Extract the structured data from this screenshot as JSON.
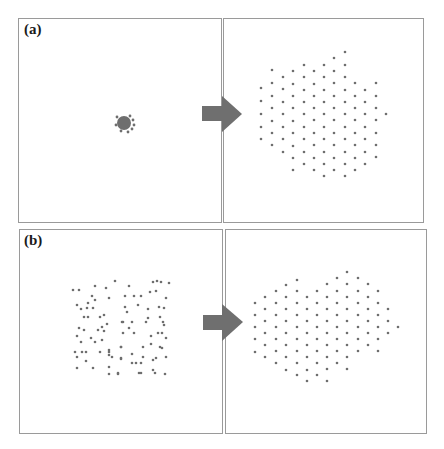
{
  "figure": {
    "panels": [
      {
        "id": "a-initial",
        "row_label": "(a)",
        "x": 18,
        "y": 18,
        "w": 204,
        "h": 205
      },
      {
        "id": "a-final",
        "row_label": "",
        "x": 223,
        "y": 18,
        "w": 201,
        "h": 205
      },
      {
        "id": "b-initial",
        "row_label": "(b)",
        "x": 19,
        "y": 229,
        "w": 204,
        "h": 205
      },
      {
        "id": "b-final",
        "row_label": "",
        "x": 225,
        "y": 229,
        "w": 202,
        "h": 205
      }
    ],
    "row_labels": {
      "a": "(a)",
      "b": "(b)"
    },
    "colors": {
      "dot": "#6e6e6e",
      "arrow": "#6f6f6f",
      "border": "#9a9a9a"
    },
    "arrows": [
      {
        "row": "a",
        "shaft": [
          202,
          106,
          222,
          121
        ],
        "head": [
          [
            222,
            96
          ],
          [
            242,
            114
          ],
          [
            222,
            132
          ]
        ]
      },
      {
        "row": "b",
        "shaft": [
          203,
          315,
          222,
          330
        ],
        "head": [
          [
            222,
            304
          ],
          [
            243,
            322
          ],
          [
            222,
            341
          ]
        ]
      }
    ],
    "a_initial_cluster": {
      "cx": 124,
      "cy": 123,
      "r": 7,
      "stray": [
        [
          117,
          117
        ],
        [
          130,
          116
        ],
        [
          133,
          120
        ],
        [
          132,
          129
        ],
        [
          121,
          131
        ],
        [
          128,
          132
        ],
        [
          116,
          125
        ],
        [
          134,
          125
        ]
      ]
    },
    "a_final_lattice": [
      [
        261,
        [
          88,
          101,
          114,
          127,
          139
        ]
      ],
      [
        272,
        [
          70,
          83,
          96,
          108,
          121,
          133,
          145
        ]
      ],
      [
        283,
        [
          77,
          89,
          102,
          114,
          127,
          139,
          152
        ]
      ],
      [
        293,
        [
          71,
          84,
          96,
          108,
          121,
          133,
          146,
          158,
          170
        ]
      ],
      [
        304,
        [
          65,
          77,
          90,
          102,
          114,
          127,
          139,
          152,
          164
        ]
      ],
      [
        314,
        [
          71,
          84,
          96,
          108,
          120,
          133,
          145,
          158,
          170
        ]
      ],
      [
        324,
        [
          65,
          77,
          90,
          102,
          114,
          127,
          139,
          152,
          164,
          176
        ]
      ],
      [
        334,
        [
          58,
          71,
          83,
          96,
          108,
          120,
          133,
          145,
          158,
          170
        ]
      ],
      [
        345,
        [
          52,
          65,
          77,
          90,
          102,
          114,
          127,
          139,
          152,
          164,
          176
        ]
      ],
      [
        355,
        [
          83,
          96,
          108,
          120,
          133,
          145,
          158,
          170
        ]
      ],
      [
        365,
        [
          90,
          102,
          114,
          127,
          139,
          152,
          164
        ]
      ],
      [
        376,
        [
          83,
          96,
          108,
          120,
          133,
          145,
          157
        ]
      ],
      [
        386,
        [
          114
        ]
      ]
    ],
    "b_initial_scatter": [
      [
        73,
        290
      ],
      [
        79,
        290
      ],
      [
        95,
        286
      ],
      [
        106,
        288
      ],
      [
        92,
        296
      ],
      [
        95,
        300
      ],
      [
        109,
        298
      ],
      [
        77,
        305
      ],
      [
        88,
        303
      ],
      [
        81,
        309
      ],
      [
        87,
        308
      ],
      [
        93,
        308
      ],
      [
        84,
        317
      ],
      [
        88,
        317
      ],
      [
        100,
        317
      ],
      [
        104,
        315
      ],
      [
        107,
        324
      ],
      [
        102,
        327
      ],
      [
        79,
        328
      ],
      [
        84,
        330
      ],
      [
        98,
        330
      ],
      [
        104,
        331
      ],
      [
        77,
        336
      ],
      [
        91,
        338
      ],
      [
        81,
        342
      ],
      [
        95,
        342
      ],
      [
        102,
        340
      ],
      [
        75,
        352
      ],
      [
        82,
        352
      ],
      [
        86,
        352
      ],
      [
        100,
        352
      ],
      [
        77,
        357
      ],
      [
        109,
        355
      ],
      [
        86,
        361
      ],
      [
        77,
        368
      ],
      [
        93,
        368
      ],
      [
        109,
        367
      ],
      [
        109,
        374
      ],
      [
        118,
        374
      ],
      [
        121,
        347
      ],
      [
        122,
        322
      ],
      [
        121,
        358
      ],
      [
        115,
        281
      ],
      [
        129,
        286
      ],
      [
        153,
        282
      ],
      [
        157,
        281
      ],
      [
        161,
        282
      ],
      [
        169,
        283
      ],
      [
        125,
        296
      ],
      [
        134,
        296
      ],
      [
        141,
        296
      ],
      [
        150,
        292
      ],
      [
        156,
        291
      ],
      [
        166,
        298
      ],
      [
        125,
        307
      ],
      [
        127,
        312
      ],
      [
        138,
        305
      ],
      [
        148,
        309
      ],
      [
        159,
        307
      ],
      [
        164,
        308
      ],
      [
        123,
        322
      ],
      [
        132,
        322
      ],
      [
        146,
        322
      ],
      [
        148,
        318
      ],
      [
        160,
        317
      ],
      [
        163,
        322
      ],
      [
        164,
        325
      ],
      [
        129,
        328
      ],
      [
        134,
        333
      ],
      [
        123,
        333
      ],
      [
        151,
        336
      ],
      [
        158,
        333
      ],
      [
        162,
        333
      ],
      [
        166,
        338
      ],
      [
        121,
        347
      ],
      [
        143,
        347
      ],
      [
        151,
        344
      ],
      [
        160,
        347
      ],
      [
        162,
        348
      ],
      [
        132,
        354
      ],
      [
        143,
        357
      ],
      [
        153,
        360
      ],
      [
        156,
        358
      ],
      [
        166,
        357
      ],
      [
        121,
        359
      ],
      [
        132,
        363
      ],
      [
        136,
        363
      ],
      [
        141,
        363
      ],
      [
        153,
        370
      ],
      [
        155,
        373
      ],
      [
        139,
        373
      ],
      [
        141,
        373
      ],
      [
        165,
        374
      ],
      [
        112,
        357
      ],
      [
        118,
        373
      ],
      [
        109,
        350
      ],
      [
        109,
        352
      ]
    ],
    "b_final_lattice": [
      [
        255,
        [
          303,
          315,
          327,
          339,
          352
        ]
      ],
      [
        265,
        [
          297,
          309,
          321,
          333,
          345,
          357
        ]
      ],
      [
        276,
        [
          291,
          303,
          315,
          327,
          339,
          351,
          363
        ]
      ],
      [
        286,
        [
          285,
          297,
          309,
          321,
          333,
          345,
          357,
          370
        ]
      ],
      [
        297,
        [
          280,
          291,
          303,
          315,
          327,
          339,
          351,
          363,
          375
        ]
      ],
      [
        307,
        [
          297,
          309,
          321,
          333,
          345,
          357,
          370,
          381
        ]
      ],
      [
        317,
        [
          291,
          303,
          315,
          327,
          339,
          351,
          363,
          375
        ]
      ],
      [
        327,
        [
          284,
          297,
          309,
          321,
          333,
          345,
          357,
          369,
          381
        ]
      ],
      [
        337,
        [
          278,
          291,
          303,
          315,
          327,
          339,
          351,
          363
        ]
      ],
      [
        347,
        [
          272,
          284,
          297,
          309,
          321,
          333,
          345,
          357,
          369
        ]
      ],
      [
        358,
        [
          278,
          291,
          303,
          315,
          327,
          339,
          351
        ]
      ],
      [
        368,
        [
          284,
          297,
          309,
          321,
          333,
          345
        ]
      ],
      [
        378,
        [
          291,
          303,
          315,
          327,
          339,
          351
        ]
      ],
      [
        388,
        [
          309,
          321,
          333
        ]
      ],
      [
        398,
        [
          327
        ]
      ]
    ]
  }
}
